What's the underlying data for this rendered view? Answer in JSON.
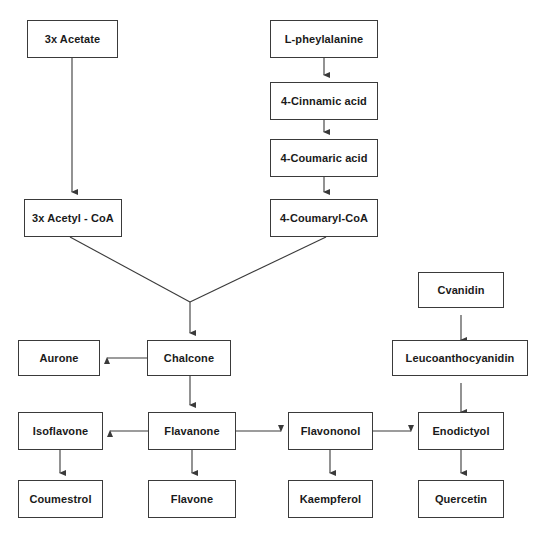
{
  "diagram": {
    "canvas": {
      "width": 536,
      "height": 541
    },
    "style": {
      "background": "#ffffff",
      "box_border": "#3a3a3a",
      "box_fill": "#ffffff",
      "text_color": "#1a1a1a",
      "edge_color": "#3a3a3a"
    },
    "nodes": [
      {
        "id": "acetate",
        "label": "3x Acetate",
        "x": 27,
        "y": 20,
        "w": 91,
        "h": 38
      },
      {
        "id": "phenylalanine",
        "label": "L-pheylalanine",
        "x": 270,
        "y": 20,
        "w": 108,
        "h": 38
      },
      {
        "id": "cinnamic",
        "label": "4-Cinnamic acid",
        "x": 270,
        "y": 82,
        "w": 108,
        "h": 38
      },
      {
        "id": "coumaric",
        "label": "4-Coumaric acid",
        "x": 270,
        "y": 139,
        "w": 108,
        "h": 38
      },
      {
        "id": "acetyl_coa",
        "label": "3x Acetyl - CoA",
        "x": 24,
        "y": 199,
        "w": 98,
        "h": 38
      },
      {
        "id": "coumaryl_coa",
        "label": "4-Coumaryl-CoA",
        "x": 270,
        "y": 199,
        "w": 108,
        "h": 38
      },
      {
        "id": "cyanidin",
        "label": "Cvanidin",
        "x": 418,
        "y": 272,
        "w": 86,
        "h": 36
      },
      {
        "id": "aurone",
        "label": "Aurone",
        "x": 18,
        "y": 340,
        "w": 82,
        "h": 36
      },
      {
        "id": "chalcone",
        "label": "Chalcone",
        "x": 147,
        "y": 340,
        "w": 84,
        "h": 36
      },
      {
        "id": "leucoanthocyanidin",
        "label": "Leucoanthocyanidin",
        "x": 392,
        "y": 340,
        "w": 136,
        "h": 36
      },
      {
        "id": "isoflavone",
        "label": "Isoflavone",
        "x": 18,
        "y": 412,
        "w": 85,
        "h": 38
      },
      {
        "id": "flavanone",
        "label": "Flavanone",
        "x": 148,
        "y": 412,
        "w": 88,
        "h": 38
      },
      {
        "id": "flavononol",
        "label": "Flavononol",
        "x": 288,
        "y": 412,
        "w": 85,
        "h": 38
      },
      {
        "id": "enodictyol",
        "label": "Enodictyol",
        "x": 418,
        "y": 412,
        "w": 86,
        "h": 38
      },
      {
        "id": "coumestrol",
        "label": "Coumestrol",
        "x": 18,
        "y": 480,
        "w": 85,
        "h": 38
      },
      {
        "id": "flavone",
        "label": "Flavone",
        "x": 148,
        "y": 480,
        "w": 88,
        "h": 38
      },
      {
        "id": "kaempferol",
        "label": "Kaempferol",
        "x": 288,
        "y": 480,
        "w": 85,
        "h": 38
      },
      {
        "id": "quercetin",
        "label": "Quercetin",
        "x": 418,
        "y": 480,
        "w": 86,
        "h": 38
      }
    ],
    "edges": [
      {
        "id": "acetate-to-acetylcoa",
        "from": "acetate",
        "to": "acetyl_coa",
        "kind": "vertical-down"
      },
      {
        "id": "phenylalanine-to-cinnamic",
        "from": "phenylalanine",
        "to": "cinnamic",
        "kind": "vertical-down"
      },
      {
        "id": "cinnamic-to-coumaric",
        "from": "cinnamic",
        "to": "coumaric",
        "kind": "vertical-down"
      },
      {
        "id": "coumaric-to-coumarylcoa",
        "from": "coumaric",
        "to": "coumaryl_coa",
        "kind": "vertical-down"
      },
      {
        "id": "acetylcoa-to-junction",
        "from": "acetyl_coa",
        "to": "chalcone",
        "kind": "diagonal-merge"
      },
      {
        "id": "coumarylcoa-to-junction",
        "from": "coumaryl_coa",
        "to": "chalcone",
        "kind": "diagonal-merge"
      },
      {
        "id": "junction-to-chalcone",
        "from": "junction",
        "to": "chalcone",
        "kind": "vertical-down"
      },
      {
        "id": "chalcone-to-aurone",
        "from": "chalcone",
        "to": "aurone",
        "kind": "horizontal-left"
      },
      {
        "id": "chalcone-to-flavanone",
        "from": "chalcone",
        "to": "flavanone",
        "kind": "vertical-down"
      },
      {
        "id": "flavanone-to-isoflavone",
        "from": "flavanone",
        "to": "isoflavone",
        "kind": "horizontal-left"
      },
      {
        "id": "flavanone-to-flavone",
        "from": "flavanone",
        "to": "flavone",
        "kind": "vertical-down"
      },
      {
        "id": "flavanone-to-flavononol",
        "from": "flavanone",
        "to": "flavononol",
        "kind": "horizontal-right"
      },
      {
        "id": "isoflavone-to-coumestrol",
        "from": "isoflavone",
        "to": "coumestrol",
        "kind": "vertical-down"
      },
      {
        "id": "flavononol-to-kaempferol",
        "from": "flavononol",
        "to": "kaempferol",
        "kind": "vertical-down"
      },
      {
        "id": "flavononol-to-enodictyol",
        "from": "flavononol",
        "to": "enodictyol",
        "kind": "horizontal-right"
      },
      {
        "id": "enodictyol-to-leuco",
        "from": "enodictyol",
        "to": "leucoanthocyanidin",
        "kind": "vertical-up"
      },
      {
        "id": "enodictyol-to-quercetin",
        "from": "enodictyol",
        "to": "quercetin",
        "kind": "vertical-down"
      },
      {
        "id": "leuco-to-cyanidin",
        "from": "leucoanthocyanidin",
        "to": "cyanidin",
        "kind": "vertical-up"
      }
    ]
  }
}
